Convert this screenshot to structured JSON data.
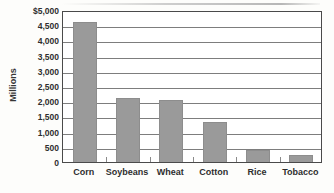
{
  "chart_data": {
    "type": "bar",
    "title": "",
    "subtitle": "",
    "xlabel": "",
    "ylabel": "Millions",
    "categories": [
      "Corn",
      "Soybeans",
      "Wheat",
      "Cotton",
      "Rice",
      "Tobacco"
    ],
    "values": [
      4600,
      2100,
      2050,
      1300,
      400,
      230
    ],
    "series": [
      {
        "name": "",
        "values": [
          4600,
          2100,
          2050,
          1300,
          400,
          230
        ]
      }
    ],
    "ylim": [
      0,
      5000
    ],
    "ytick_step": 500,
    "ytick_labels": [
      "$5,000",
      "4,500",
      "4,000",
      "3,500",
      "3,000",
      "2,500",
      "2,000",
      "1,500",
      "1,000",
      "500",
      "0"
    ],
    "ytick_values": [
      5000,
      4500,
      4000,
      3500,
      3000,
      2500,
      2000,
      1500,
      1000,
      500,
      0
    ],
    "grid": true,
    "grid_axis": "y",
    "legend": false,
    "legend_position": "none",
    "bar_color": "#9a9a9a",
    "bar_edge_color": "#8d8d8d",
    "gridline_color": "#7d7d7d",
    "frame_color": "#4a4a4a",
    "background_color": "#fdfdfb",
    "plot_background_color": "#ffffff",
    "text_color": "#2e2e2e",
    "annotations": []
  }
}
